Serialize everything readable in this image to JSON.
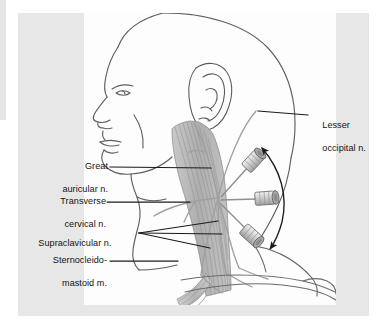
{
  "figure": {
    "background_color": "#e7e7e7",
    "inset_color": "#fdfdfd",
    "ink_color": "#4a4a4a",
    "text_color": "#131313",
    "muscle_fill": "#b9b9b9"
  },
  "labels": {
    "lesser_occipital": {
      "line1": "Lesser",
      "line2": "occipital n."
    },
    "great_auricular": {
      "line1": "Great",
      "line2": "auricular n."
    },
    "transverse_cervical": {
      "line1": "Transverse",
      "line2": "cervical n."
    },
    "supraclavicular": {
      "line1": "Supraclavicular n."
    },
    "sternocleidomastoid": {
      "line1": "Sternocleido-",
      "line2": "mastoid m."
    }
  },
  "annotations": {
    "needle_count": 3,
    "arrow_type": "double-headed curved arrow",
    "plexus_point": "Erb's point — nerve radiation center"
  }
}
